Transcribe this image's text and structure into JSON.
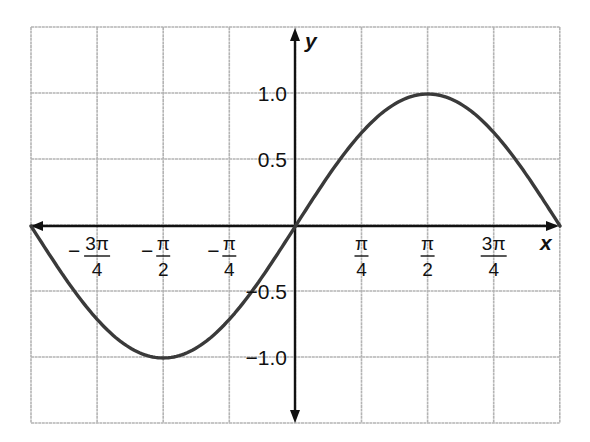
{
  "chart_data": {
    "type": "line",
    "title": "",
    "function": "y = sin(2x)",
    "xlabel": "x",
    "ylabel": "y",
    "xlim": [
      -3.1416,
      0.9817
    ],
    "ylim": [
      -1.5,
      1.5
    ],
    "grid": true,
    "legend": null,
    "x_ticks": [
      {
        "value": -2.3562,
        "sign": "−",
        "numerator": "3π",
        "denominator": "4"
      },
      {
        "value": -1.5708,
        "sign": "−",
        "numerator": "π",
        "denominator": "2"
      },
      {
        "value": -0.7854,
        "sign": "−",
        "numerator": "π",
        "denominator": "4"
      },
      {
        "value": 0.7854,
        "sign": "",
        "numerator": "π",
        "denominator": "4"
      },
      {
        "value": 1.5708,
        "sign": "",
        "numerator": "π",
        "denominator": "2"
      },
      {
        "value": 2.3562,
        "sign": "",
        "numerator": "3π",
        "denominator": "4"
      }
    ],
    "y_ticks": [
      {
        "value": 1.0,
        "label": "1.0"
      },
      {
        "value": 0.5,
        "label": "0.5"
      },
      {
        "value": -0.5,
        "label": "−0.5"
      },
      {
        "value": -1.0,
        "label": "−1.0"
      }
    ],
    "series": [
      {
        "name": "y = sin x",
        "x": [
          -3.1416,
          -2.3562,
          -1.5708,
          -0.7854,
          0,
          0.7854,
          1.5708,
          2.3562,
          3.1416
        ],
        "y": [
          0,
          -0.7071,
          -1.0,
          -0.7071,
          0,
          0.7071,
          1.0,
          0.7071,
          0
        ]
      }
    ],
    "annotations": [
      "curve is drawn from x = -π to x = π; right grid edge at x = π"
    ]
  },
  "axes": {
    "x_name": "x",
    "y_name": "y"
  }
}
